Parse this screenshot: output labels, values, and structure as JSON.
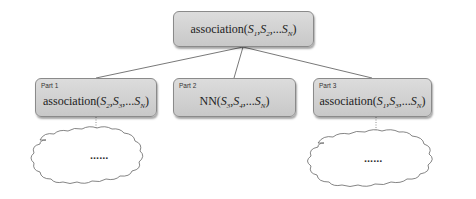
{
  "root": {
    "func": "association",
    "args": [
      {
        "sym": "S",
        "sub": "1"
      },
      {
        "sym": "S",
        "sub": "2"
      },
      {
        "sym": "S",
        "sub": "N"
      }
    ],
    "sep1": ",",
    "sep2": ",...",
    "open": "(",
    "close": ")"
  },
  "parts": [
    {
      "label": "Part 1",
      "func": "association",
      "args": [
        {
          "sym": "S",
          "sub": "2"
        },
        {
          "sym": "S",
          "sub": "3"
        },
        {
          "sym": "S",
          "sub": "N"
        }
      ]
    },
    {
      "label": "Part 2",
      "func": "NN",
      "args": [
        {
          "sym": "S",
          "sub": "3"
        },
        {
          "sym": "S",
          "sub": "4"
        },
        {
          "sym": "S",
          "sub": "N"
        }
      ]
    },
    {
      "label": "Part 3",
      "func": "association",
      "args": [
        {
          "sym": "S",
          "sub": "1"
        },
        {
          "sym": "S",
          "sub": "3"
        },
        {
          "sym": "S",
          "sub": "N"
        }
      ]
    }
  ],
  "punct": {
    "open": "(",
    "close": ")",
    "comma": ",",
    "comma_dots": ",..."
  },
  "clouds": [
    {
      "text": "......"
    },
    {
      "text": "......"
    }
  ],
  "colors": {
    "box_fill": "#d0d0d0",
    "box_border": "#8a8a8a",
    "line": "#555555"
  }
}
